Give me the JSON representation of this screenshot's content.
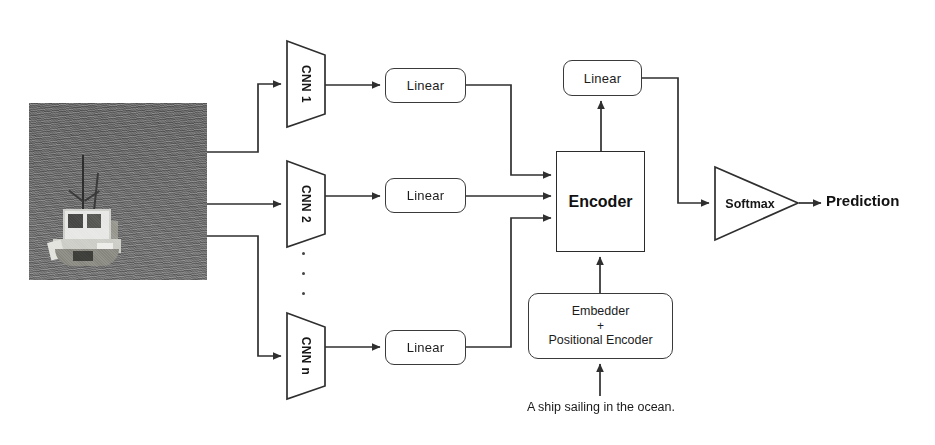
{
  "diagram": {
    "input_image": {
      "alt": "grayscale photograph of a small fishing boat on open water",
      "icon": "photo-thumbnail"
    },
    "cnn_branches": [
      {
        "label": "CNN 1"
      },
      {
        "label": "CNN 2"
      },
      {
        "label": "CNN n"
      }
    ],
    "branch_linear_label": "Linear",
    "linear_boxes": [
      {
        "label": "Linear"
      },
      {
        "label": "Linear"
      },
      {
        "label": "Linear"
      }
    ],
    "ellipsis": "...",
    "encoder": {
      "label": "Encoder"
    },
    "top_linear": {
      "label": "Linear"
    },
    "embedder": {
      "line1": "Embedder",
      "plus": "+",
      "line2": "Positional Encoder"
    },
    "text_input": "A ship sailing in the ocean.",
    "softmax": {
      "label": "Softmax"
    },
    "output": {
      "label": "Prediction"
    },
    "colors": {
      "stroke": "#3a3a3a",
      "encoder_stroke": "#2b2b2b",
      "text": "#111111",
      "background": "#ffffff",
      "photo_tone": "#6f6f6f"
    }
  }
}
